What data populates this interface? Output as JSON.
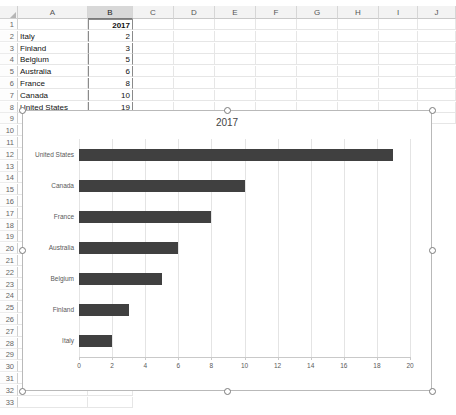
{
  "spreadsheet": {
    "columns": [
      "A",
      "B",
      "C",
      "D",
      "E",
      "F",
      "G",
      "H",
      "I",
      "J"
    ],
    "selected_column": "B",
    "rows": [
      1,
      2,
      3,
      4,
      5,
      6,
      7,
      8,
      9,
      10,
      11,
      12,
      13,
      14,
      15,
      16,
      17,
      18,
      19,
      20,
      21,
      22,
      23,
      24,
      25,
      26,
      27,
      28,
      29,
      30,
      31,
      32,
      33
    ],
    "cells": [
      {
        "row": 1,
        "a": "",
        "b": "2017",
        "bold": true
      },
      {
        "row": 2,
        "a": "Italy",
        "b": "2"
      },
      {
        "row": 3,
        "a": "Finland",
        "b": "3"
      },
      {
        "row": 4,
        "a": "Belgium",
        "b": "5"
      },
      {
        "row": 5,
        "a": "Australia",
        "b": "6"
      },
      {
        "row": 6,
        "a": "France",
        "b": "8"
      },
      {
        "row": 7,
        "a": "Canada",
        "b": "10"
      },
      {
        "row": 8,
        "a": "United States",
        "b": "19"
      }
    ]
  },
  "chart": {
    "selected": true,
    "bar_color": "#404040",
    "gridline_color": "#e4e4e4",
    "axis_color": "#c9c9c9",
    "handle_count": 8
  },
  "chart_data": {
    "type": "bar",
    "orientation": "horizontal",
    "title": "2017",
    "xlabel": "",
    "ylabel": "",
    "categories": [
      "United States",
      "Canada",
      "France",
      "Australia",
      "Belgium",
      "Finland",
      "Italy"
    ],
    "values": [
      19,
      10,
      8,
      6,
      5,
      3,
      2
    ],
    "xlim": [
      0,
      20
    ],
    "xticks": [
      0,
      2,
      4,
      6,
      8,
      10,
      12,
      14,
      16,
      18,
      20
    ],
    "grid": true,
    "legend": false,
    "series": [
      {
        "name": "2017",
        "values": [
          19,
          10,
          8,
          6,
          5,
          3,
          2
        ]
      }
    ]
  }
}
